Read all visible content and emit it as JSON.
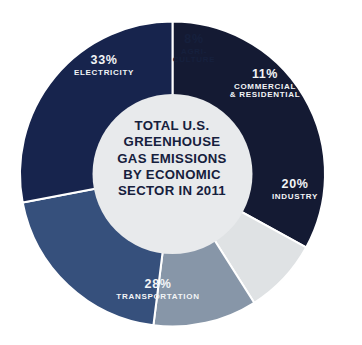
{
  "chart_data": {
    "type": "pie",
    "variant": "donut",
    "title": "TOTAL U.S. GREENHOUSE GAS EMISSIONS BY ECONOMIC SECTOR IN 2011",
    "title_lines": [
      "TOTAL U.S.",
      "GREENHOUSE",
      "GAS EMISSIONS",
      "BY ECONOMIC",
      "SECTOR IN 2011"
    ],
    "units": "percent",
    "total": 100,
    "legend": "none",
    "grid": false,
    "categories": [
      "ELECTRICITY",
      "AGRICULTURE",
      "COMMERCIAL & RESIDENTIAL",
      "INDUSTRY",
      "TRANSPORTATION"
    ],
    "values": [
      33,
      8,
      11,
      20,
      28
    ],
    "slices": [
      {
        "label_pct": "33%",
        "label_name": "ELECTRICITY",
        "value": 33,
        "color": "#141a33",
        "text_color": "#f2f4f6"
      },
      {
        "label_pct": "8%",
        "label_name": "AGRI-\nCULTURE",
        "label_name_line1": "AGRI-",
        "label_name_line2": "CULTURE",
        "value": 8,
        "color": "#dfe2e4",
        "text_color": "#16203d"
      },
      {
        "label_pct": "11%",
        "label_name": "COMMERCIAL & RESIDENTIAL",
        "label_name_line1": "COMMERCIAL",
        "label_name_line2": "& RESIDENTIAL",
        "value": 11,
        "color": "#8796a8",
        "text_color": "#f2f4f6"
      },
      {
        "label_pct": "20%",
        "label_name": "INDUSTRY",
        "value": 20,
        "color": "#36507c",
        "text_color": "#f2f4f6"
      },
      {
        "label_pct": "28%",
        "label_name": "TRANSPORTATION",
        "value": 28,
        "color": "#17244d",
        "text_color": "#f2f4f6"
      }
    ],
    "center_fill": "#e8eaec",
    "background": "#ffffff"
  }
}
